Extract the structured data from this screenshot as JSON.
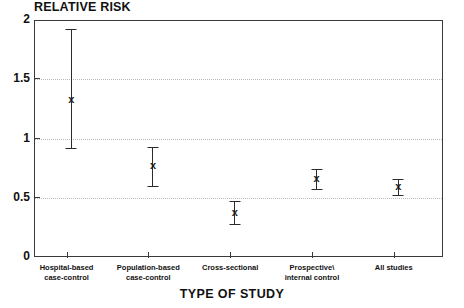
{
  "chart_data": {
    "type": "scatter",
    "title": "",
    "ylabel": "RELATIVE RISK",
    "xlabel": "TYPE OF STUDY",
    "ylim": [
      0,
      2
    ],
    "yticks": [
      "0",
      "0.5",
      "1",
      "1.5",
      "2"
    ],
    "ytick_values": [
      0,
      0.5,
      1,
      1.5,
      2
    ],
    "grid": true,
    "grid_axis": "y",
    "legend": "none",
    "marker_symbol": "x",
    "error_bars": "vertical",
    "categories": [
      "Hospital-based case-control",
      "Population-based case-control",
      "Cross-sectional",
      "Prospective\\ internal control",
      "All studies"
    ],
    "category_lines": [
      [
        "Hospital-based",
        "case-control"
      ],
      [
        "Population-based",
        "case-control"
      ],
      [
        "Cross-sectional",
        ""
      ],
      [
        "Prospective\\",
        "internal control"
      ],
      [
        "All studies",
        ""
      ]
    ],
    "points": [
      {
        "label": "Hospital-based case-control",
        "value": 1.33,
        "low": 0.92,
        "high": 1.92
      },
      {
        "label": "Population-based case-control",
        "value": 0.78,
        "low": 0.6,
        "high": 0.93
      },
      {
        "label": "Cross-sectional",
        "value": 0.38,
        "low": 0.28,
        "high": 0.47
      },
      {
        "label": "Prospective\\ internal control",
        "value": 0.67,
        "low": 0.57,
        "high": 0.74
      },
      {
        "label": "All studies",
        "value": 0.6,
        "low": 0.52,
        "high": 0.66
      }
    ],
    "colors": {
      "axis": "#3a3a3a",
      "grid": "#b9b9b9",
      "marker": "#1a1a1a",
      "background": "#ffffff"
    }
  }
}
